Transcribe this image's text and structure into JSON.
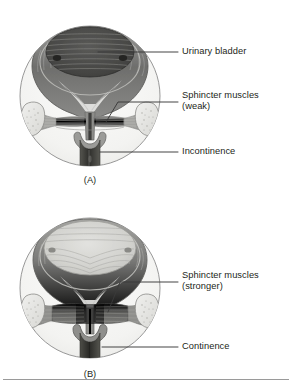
{
  "figure": {
    "type": "anatomical-diagram",
    "view": "midsagittal / coronal cut-away circle inset"
  },
  "panels": [
    {
      "id": "A",
      "caption": "(A)",
      "state": "weak sphincter — leaking",
      "bladder_fill": "full",
      "labels": [
        {
          "name": "urinary-bladder",
          "text": "Urinary bladder",
          "lines": [
            "Urinary bladder"
          ]
        },
        {
          "name": "sphincter-muscles-weak",
          "text": "Sphincter muscles (weak)",
          "lines": [
            "Sphincter muscles",
            "(weak)"
          ]
        },
        {
          "name": "incontinence",
          "text": "Incontinence",
          "lines": [
            "Incontinence"
          ]
        }
      ]
    },
    {
      "id": "B",
      "caption": "(B)",
      "state": "stronger sphincter — holding",
      "bladder_fill": "relaxed",
      "labels": [
        {
          "name": "sphincter-muscles-stronger",
          "text": "Sphincter muscles (stronger)",
          "lines": [
            "Sphincter muscles",
            "(stronger)"
          ]
        },
        {
          "name": "continence",
          "text": "Continence",
          "lines": [
            "Continence"
          ]
        }
      ]
    }
  ],
  "label_text": {
    "urinary_bladder": "Urinary bladder",
    "sphincter_weak_line1": "Sphincter muscles",
    "sphincter_weak_line2": "(weak)",
    "incontinence": "Incontinence",
    "sphincter_strong_line1": "Sphincter muscles",
    "sphincter_strong_line2": "(stronger)",
    "continence": "Continence",
    "caption_a": "(A)",
    "caption_b": "(B)"
  },
  "colors": {
    "ink": "#231f20",
    "leader_line": "#3a3a3a",
    "circle_outline": "#8c8c8c",
    "circle_fill": "#f4f4f2",
    "bladder_wall_dark": "#6d6d6d",
    "bladder_wall_mid": "#9a9a9a",
    "bladder_lumen_full": "#4a4a4a",
    "bladder_lumen_empty": "#c9c9c7",
    "muscle_weak": "#8e8e8c",
    "muscle_strong": "#6b6b69",
    "urethra_dark": "#3f3f3f",
    "bone_fill": "#e3e3e0",
    "bone_outline": "#8a8a88",
    "page_rule": "#9a9a9a"
  }
}
